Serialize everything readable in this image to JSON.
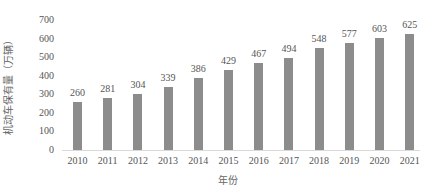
{
  "chart_data": {
    "type": "bar",
    "title": "",
    "xlabel": "年份",
    "ylabel": "机动车保有量（万辆）",
    "categories": [
      "2010",
      "2011",
      "2012",
      "2013",
      "2014",
      "2015",
      "2016",
      "2017",
      "2018",
      "2019",
      "2020",
      "2021"
    ],
    "values": [
      260,
      281,
      304,
      339,
      386,
      429,
      467,
      494,
      548,
      577,
      603,
      625
    ],
    "yticks": [
      0,
      100,
      200,
      300,
      400,
      500,
      600,
      700
    ],
    "ylim": [
      0,
      700
    ],
    "grid": false,
    "legend": null,
    "data_labels": true,
    "bar_color": "#8c8c8c"
  },
  "axes": {
    "xlabel": "年份",
    "ylabel": "机动车保有量（万辆）"
  }
}
